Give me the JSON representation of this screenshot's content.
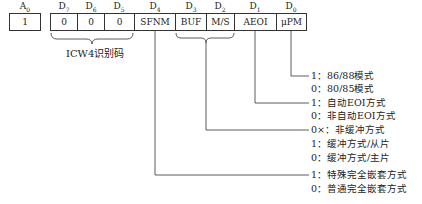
{
  "diagram": {
    "bit_labels": [
      "A0",
      "D7",
      "D6",
      "D5",
      "D4",
      "D3",
      "D2",
      "D1",
      "D0"
    ],
    "cells": [
      "1",
      "0",
      "0",
      "0",
      "SFNM",
      "BUF",
      "M/S",
      "AEOI",
      "μPM"
    ],
    "icw_label": "ICW4识别码",
    "fields": {
      "upm": [
        "1：86/88模式",
        "0：80/85模式"
      ],
      "aeoi": [
        "1：自动EOI方式",
        "0：非自动EOI方式"
      ],
      "buf_ms": [
        "0×：非缓冲方式",
        "1：缓冲方式/从片",
        "0：缓冲方式/主片"
      ],
      "sfnm": [
        "1：特殊完全嵌套方式",
        "0：普通完全嵌套方式"
      ]
    }
  }
}
